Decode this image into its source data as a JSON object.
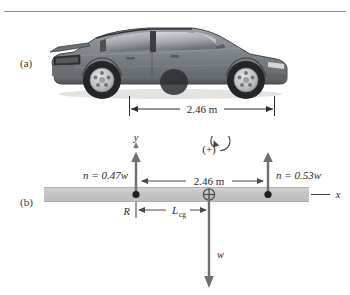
{
  "figure": {
    "panels": [
      {
        "id": "a",
        "label": "(a)",
        "caption_icon": "car-side-photo"
      },
      {
        "id": "b",
        "label": "(b)",
        "caption_icon": "free-body-diagram"
      }
    ],
    "colors": {
      "rule": "#8e8e8e",
      "ground_bar": "#c9c9c9",
      "ground_bar_edge": "#b4b4b4",
      "ink": "#2b2b2b",
      "arrow_gray": "#6f6f6f",
      "car_body": "#7c8086",
      "car_dark": "#3a3d41",
      "car_glass": "#b9bec4",
      "tire": "#2a2a2a",
      "wheel_rim": "#cfd2d6"
    }
  },
  "panel_a": {
    "label": "(a)",
    "dimension": {
      "value": "2.46 m",
      "left_tick": "rear-wheel-contact",
      "right_tick": "front-wheel-contact",
      "arrow_style": "double-headed"
    }
  },
  "panel_b": {
    "label": "(b)",
    "axes": {
      "y_label": "y",
      "x_label": "x",
      "y_axis_style": "dashed-vertical",
      "x_axis_style": "solid-horizontal"
    },
    "sign_convention": {
      "symbol": "(+)",
      "sense": "counterclockwise-positive",
      "icon": "rotation-arrow-ccw-icon"
    },
    "forces": [
      {
        "name": "normal-force-rear",
        "label": "n = 0.47w",
        "label_symbol": "n",
        "label_equals": "=",
        "label_value": "0.47w",
        "direction": "up",
        "applied_at": "rear-wheel-contact-point"
      },
      {
        "name": "normal-force-front",
        "label": "n = 0.53w",
        "label_symbol": "n",
        "label_equals": "=",
        "label_value": "0.53w",
        "direction": "up",
        "applied_at": "front-wheel-contact-point"
      },
      {
        "name": "weight",
        "label": "w",
        "direction": "down",
        "applied_at": "center-of-gravity"
      }
    ],
    "dimensions": [
      {
        "name": "wheelbase",
        "value": "2.46 m",
        "from": "rear-wheel-contact-point",
        "to": "front-wheel-contact-point",
        "arrow_style": "double-headed"
      },
      {
        "name": "cg-distance",
        "value": "L",
        "subscript": "cg",
        "from": "rotation-axis-R",
        "to": "center-of-gravity",
        "arrow_style": "double-headed"
      }
    ],
    "markers": [
      {
        "name": "pivot-label",
        "label": "R"
      },
      {
        "name": "center-of-gravity-marker",
        "icon": "circled-cross-icon"
      },
      {
        "name": "contact-point-rear",
        "icon": "filled-dot-icon"
      },
      {
        "name": "contact-point-front",
        "icon": "filled-dot-icon"
      }
    ]
  }
}
